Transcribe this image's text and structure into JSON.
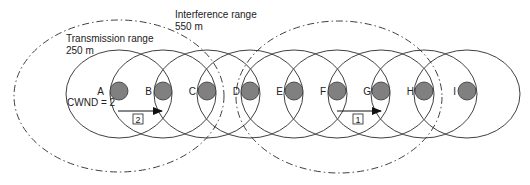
{
  "figure": {
    "colors": {
      "line": "#2a2a2a",
      "node_fill": "#808080",
      "node_stroke": "#333333",
      "background": "#ffffff"
    },
    "labels": {
      "interference_title": "Interference range",
      "interference_value": "550 m",
      "transmission_title": "Transmission range",
      "transmission_value": "250 m",
      "cwnd": "CWND = 2"
    },
    "nodes": [
      {
        "id": "A",
        "x": 119
      },
      {
        "id": "B",
        "x": 163
      },
      {
        "id": "C",
        "x": 207
      },
      {
        "id": "D",
        "x": 250
      },
      {
        "id": "E",
        "x": 294
      },
      {
        "id": "F",
        "x": 337
      },
      {
        "id": "G",
        "x": 381
      },
      {
        "id": "H",
        "x": 424
      },
      {
        "id": "I",
        "x": 467
      }
    ],
    "node_y": 91,
    "node_radius": 9,
    "transmission_ellipse": {
      "rx": 53,
      "ry": 44,
      "cy": 94
    },
    "interference_ellipses": [
      {
        "name": "left",
        "cx": 119,
        "cy": 96,
        "rx": 105,
        "ry": 76
      },
      {
        "name": "right",
        "cx": 339,
        "cy": 97,
        "rx": 103,
        "ry": 76
      }
    ],
    "flows": [
      {
        "id": "2",
        "from": "A",
        "to": "B",
        "label": "2"
      },
      {
        "id": "1",
        "from": "F",
        "to": "G",
        "label": "1"
      }
    ]
  }
}
